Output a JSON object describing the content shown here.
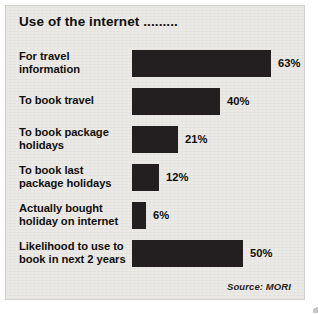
{
  "panel": {
    "title": "Use of the internet .........",
    "source_note": "Source: MORI",
    "background_color": "#ebeae7",
    "border_color": "#d2d1ce",
    "bar_color": "#231f20",
    "text_color": "#100f0d"
  },
  "chart_data": {
    "type": "bar",
    "orientation": "horizontal",
    "title": "Use of the internet .........",
    "xlabel": "",
    "ylabel": "",
    "xlim": [
      0,
      70
    ],
    "grid": false,
    "legend": false,
    "value_suffix": "%",
    "source": "Source: MORI",
    "categories": [
      "For travel information",
      "To book travel",
      "To book package holidays",
      "To book last package holidays",
      "Actually bought holiday on internet",
      "Likelihood to use to book in next 2 years"
    ],
    "values": [
      63,
      40,
      21,
      12,
      6,
      50
    ],
    "value_labels": [
      "63%",
      "40%",
      "21%",
      "12%",
      "6%",
      "50%"
    ]
  },
  "rows": [
    {
      "label_line1": "For travel",
      "label_line2": "information",
      "value": 63,
      "value_label": "63%",
      "bar_px": 139
    },
    {
      "label_line1": "To book travel",
      "label_line2": "",
      "value": 40,
      "value_label": "40%",
      "bar_px": 88
    },
    {
      "label_line1": "To book package",
      "label_line2": "holidays",
      "value": 21,
      "value_label": "21%",
      "bar_px": 46
    },
    {
      "label_line1": "To book last",
      "label_line2": "package holidays",
      "value": 12,
      "value_label": "12%",
      "bar_px": 27
    },
    {
      "label_line1": "Actually bought",
      "label_line2": "holiday on internet",
      "value": 6,
      "value_label": "6%",
      "bar_px": 14
    },
    {
      "label_line1": "Likelihood to use to",
      "label_line2": "book in next 2 years",
      "value": 50,
      "value_label": "50%",
      "bar_px": 111
    }
  ]
}
